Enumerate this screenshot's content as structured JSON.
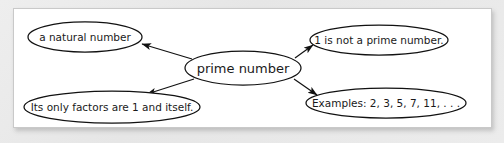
{
  "diagram": {
    "type": "concept-map",
    "background_color": "#e9e9e9",
    "panel_color": "#ffffff",
    "stroke_color": "#111111",
    "center": {
      "id": "prime-number",
      "label": "prime number",
      "cx": 229,
      "cy": 59,
      "rx": 58,
      "ry": 17,
      "font_size": 13
    },
    "nodes": [
      {
        "id": "natural-number",
        "label": "a natural number",
        "cx": 71,
        "cy": 28,
        "rx": 57,
        "ry": 15,
        "font_size": 10.5
      },
      {
        "id": "one-not-prime",
        "label": "1 is not a prime number.",
        "cx": 365,
        "cy": 31,
        "rx": 69,
        "ry": 15,
        "font_size": 10.5
      },
      {
        "id": "only-factors",
        "label": "Its only factors are 1 and itself.",
        "cx": 98,
        "cy": 98,
        "rx": 88,
        "ry": 16,
        "font_size": 10.5
      },
      {
        "id": "examples",
        "label": "Examples: 2, 3, 5, 7, 11, . . .",
        "cx": 372,
        "cy": 94,
        "rx": 80,
        "ry": 15,
        "font_size": 10.5
      }
    ],
    "edges": [
      {
        "id": "edge-to-natural-number",
        "from": "prime-number",
        "to": "natural-number",
        "x1": 178,
        "y1": 50,
        "x2": 128,
        "y2": 35,
        "arrow": "end"
      },
      {
        "id": "edge-to-one-not-prime",
        "from": "prime-number",
        "to": "one-not-prime",
        "x1": 281,
        "y1": 49,
        "x2": 299,
        "y2": 36,
        "arrow": "end"
      },
      {
        "id": "edge-to-only-factors",
        "from": "prime-number",
        "to": "only-factors",
        "x1": 180,
        "y1": 70,
        "x2": 133,
        "y2": 85,
        "arrow": "end"
      },
      {
        "id": "edge-to-examples",
        "from": "prime-number",
        "to": "examples",
        "x1": 280,
        "y1": 70,
        "x2": 303,
        "y2": 86,
        "arrow": "end"
      }
    ]
  }
}
